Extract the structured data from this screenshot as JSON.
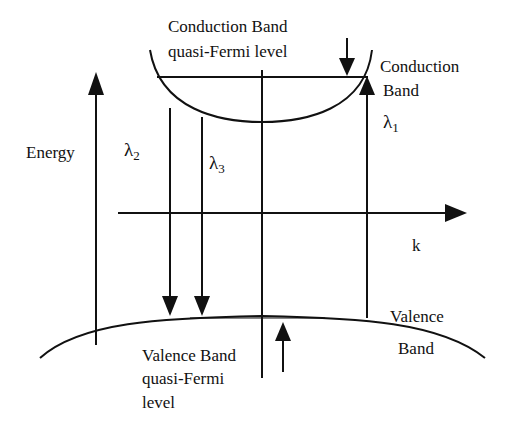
{
  "diagram": {
    "axes": {
      "vertical_label": "Energy",
      "horizontal_label": "k"
    },
    "labels": {
      "cb_fermi_line1": "Conduction Band",
      "cb_fermi_line2": "quasi-Fermi level",
      "cb_line1": "Conduction",
      "cb_line2": "Band",
      "vb_line1": "Valence",
      "vb_line2": "Band",
      "vb_fermi_line1": "Valence Band",
      "vb_fermi_line2": "quasi-Fermi",
      "vb_fermi_line3": "level"
    },
    "transitions": [
      {
        "symbol": "λ",
        "subscript": "1",
        "direction": "up"
      },
      {
        "symbol": "λ",
        "subscript": "2",
        "direction": "down"
      },
      {
        "symbol": "λ",
        "subscript": "3",
        "direction": "down"
      }
    ],
    "colors": {
      "line": "#111111",
      "background": "#ffffff"
    }
  }
}
